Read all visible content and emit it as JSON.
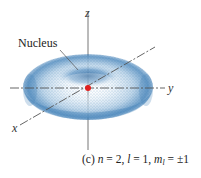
{
  "figure": {
    "labels": {
      "nucleus": "Nucleus",
      "z_axis": "z",
      "y_axis": "y",
      "x_axis": "x"
    },
    "caption": {
      "panel": "(c)",
      "n_symbol": "n",
      "n_value": " = 2, ",
      "l_symbol": "l",
      "l_value": " = 1, ",
      "m_symbol": "m",
      "m_subscript": "l",
      "m_value": " = ±1"
    },
    "colors": {
      "cloud": "#3a7bb5",
      "cloud_dark": "#1d5a94",
      "nucleus": "#e02020",
      "axis": "#555555"
    }
  }
}
